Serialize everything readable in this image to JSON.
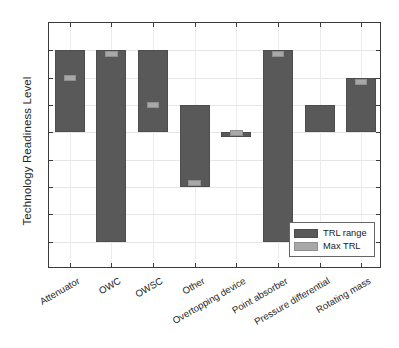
{
  "chart_data": {
    "type": "bar",
    "title": "",
    "xlabel": "",
    "ylabel": "Technology Readiness Level",
    "ylim": [
      0,
      9
    ],
    "ytick_labels": [
      "0",
      "1",
      "2",
      "3",
      "4",
      "5",
      "6",
      "7",
      "8",
      "9"
    ],
    "grid": true,
    "legend_position": "lower right",
    "categories": [
      "Attenuator",
      "OWC",
      "OWSC",
      "Other",
      "Overtopping device",
      "Point absorber",
      "Pressure differential",
      "Rotating mass"
    ],
    "series": [
      {
        "name": "TRL range",
        "color": "#595959",
        "type": "range",
        "low": [
          5,
          1,
          5,
          3,
          5,
          1,
          5,
          5
        ],
        "high": [
          8,
          8,
          8,
          6,
          5,
          8,
          6,
          7
        ]
      },
      {
        "name": "Max TRL",
        "color": "#a8a8a8",
        "type": "marker",
        "values": [
          7,
          8,
          6,
          3,
          5,
          8,
          null,
          7
        ]
      }
    ]
  },
  "legend": {
    "items": [
      {
        "label": "TRL range",
        "swatch": "range"
      },
      {
        "label": "Max TRL",
        "swatch": "max"
      }
    ]
  }
}
